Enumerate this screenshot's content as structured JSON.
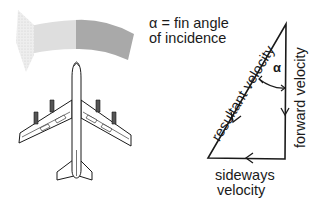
{
  "diagram": {
    "type": "aircraft fin angle of incidence vector diagram",
    "legend": {
      "line1": "α = fin angle",
      "line2": "of incidence"
    },
    "triangle": {
      "alpha_symbol": "α",
      "resultant_label": "resultant velocity",
      "forward_label": "forward velocity",
      "sideways_line1": "sideways",
      "sideways_line2": "velocity"
    },
    "colors": {
      "line": "#1a1a1a",
      "arrow_dark": "#a8a8a8",
      "arrow_light": "#dcdcdc",
      "arrow_head": "#e8e8e8",
      "background": "#ffffff"
    }
  }
}
